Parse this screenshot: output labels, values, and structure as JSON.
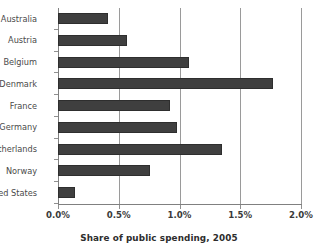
{
  "chart_data": {
    "type": "bar",
    "orientation": "horizontal",
    "title": "",
    "xlabel": "Share of public spending, 2005",
    "ylabel": "",
    "categories": [
      "Australia",
      "Austria",
      "Belgium",
      "Denmark",
      "France",
      "Germany",
      "Netherlands",
      "Norway",
      "United States"
    ],
    "values": [
      0.41,
      0.57,
      1.08,
      1.77,
      0.92,
      0.98,
      1.35,
      0.76,
      0.14
    ],
    "xlim": [
      0.0,
      2.0
    ],
    "xticks": [
      0.0,
      0.5,
      1.0,
      1.5,
      2.0
    ],
    "xtick_labels": [
      "0.0%",
      "0.5%",
      "1.0%",
      "1.5%",
      "2.0%"
    ],
    "grid": "vertical",
    "legend": "none",
    "bar_color": "#3f3f3f",
    "axis_color": "#808080",
    "gridline_color": "#9a9a9a"
  },
  "axis_title": "Share of public spending, 2005"
}
